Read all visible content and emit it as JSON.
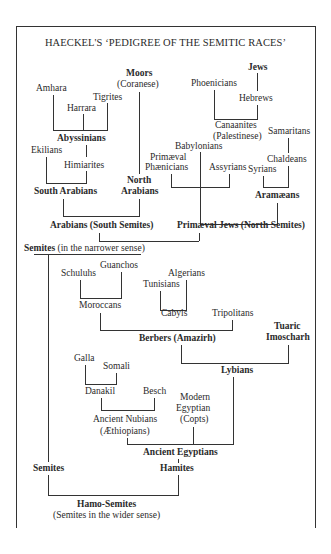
{
  "title": "HAECKEL'S ‘PEDIGREE OF THE SEMITIC RACES’",
  "nodes": {
    "amhara": "Amhara",
    "harrara": "Harrara",
    "tigrites": "Tigrites",
    "abyssinians": "Abyssinians",
    "moors": "Moors",
    "coranese": "(Coranese)",
    "ekilians": "Ekilians",
    "himiarites": "Himiarites",
    "south_arabians": "South Arabians",
    "north": "North",
    "arabians": "Arabians",
    "arabians_south_semites": "Arabians (South Semites)",
    "phoenicians": "Phoenicians",
    "jews": "Jews",
    "hebrews": "Hebrews",
    "canaanites": "Canaanites",
    "palestinese": "(Palestinese)",
    "samaritans": "Samaritans",
    "babylonians": "Babylonians",
    "primaeval": "Primæval",
    "phaenicians": "Phænicians",
    "assyrians": "Assyrians",
    "syrians": "Syrians",
    "chaldeans": "Chaldeans",
    "aramaeans": "Aramæans",
    "primaeval_jews": "Primæval Jews (North Semites)",
    "semites_narrow_bold": "Semites",
    "semites_narrow_rest": " (in the narrower sense)",
    "schuluhs": "Schuluhs",
    "guanchos": "Guanchos",
    "moroccans": "Moroccans",
    "algerians": "Algerians",
    "tunisians": "Tunisians",
    "cabyls": "Cabyls",
    "tripolitans": "Tripolitans",
    "berbers": "Berbers (Amazirh)",
    "tuaric": "Tuaric",
    "imoscharh": "Imoscharh",
    "lybians": "Lybians",
    "galla": "Galla",
    "somali": "Somali",
    "danakil": "Danakil",
    "besch": "Besch",
    "ancient_nubians": "Ancient Nubians",
    "aethiopians": "(Æthiopians)",
    "modern": "Modern",
    "egyptian": "Egyptian",
    "copts": "(Copts)",
    "ancient_egyptians": "Ancient Egyptians",
    "semites": "Semites",
    "hamites": "Hamites",
    "hamo_semites": "Hamo-Semites",
    "semites_wider": "(Semites in the wider sense)"
  }
}
